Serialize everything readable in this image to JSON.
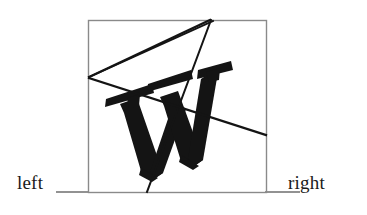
{
  "figure": {
    "background_color": "#ffffff",
    "ink_color": "#141414",
    "frame_color": "#8a8a8a",
    "rule_color": "#6e6e6e",
    "labels": {
      "left": "left",
      "right": "right"
    },
    "frame": {
      "x": 88,
      "y": 20,
      "width": 178,
      "height": 172,
      "stroke_width": 1.4
    },
    "baseline_rules": [
      {
        "name": "left-rule",
        "x1": 56,
        "y1": 192,
        "x2": 88,
        "y2": 192
      },
      {
        "name": "right-rule",
        "x1": 266,
        "y1": 192,
        "x2": 300,
        "y2": 192
      }
    ],
    "glyph": {
      "character": "W",
      "style": "heavy-serif",
      "description": "rotated bold serif capital W"
    },
    "overlay_lines": [
      {
        "name": "apex-to-left-vertex",
        "x1": 210,
        "y1": 20,
        "x2": 89,
        "y2": 77
      },
      {
        "name": "left-vertex-to-apex-2",
        "x1": 89,
        "y1": 77,
        "x2": 212,
        "y2": 22
      },
      {
        "name": "apex-to-bottom",
        "x1": 211,
        "y1": 20,
        "x2": 147,
        "y2": 192
      },
      {
        "name": "left-vertex-to-right-edge",
        "x1": 89,
        "y1": 78,
        "x2": 266,
        "y2": 135
      }
    ]
  }
}
